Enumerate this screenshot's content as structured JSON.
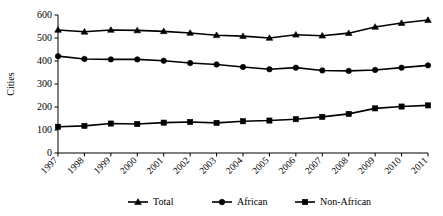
{
  "chart_data": {
    "type": "line",
    "title": "",
    "xlabel": "",
    "ylabel": "Cities",
    "ylim": [
      0,
      600
    ],
    "yticks": [
      0,
      100,
      200,
      300,
      400,
      500,
      600
    ],
    "grid": false,
    "legend_position": "bottom",
    "categories": [
      "1997",
      "1998",
      "1999",
      "2000",
      "2001",
      "2002",
      "2003",
      "2004",
      "2005",
      "2006",
      "2007",
      "2008",
      "2009",
      "2010",
      "2011"
    ],
    "series": [
      {
        "name": "Total",
        "marker": "triangle",
        "color": "#000000",
        "values": [
          535,
          527,
          535,
          533,
          529,
          522,
          512,
          508,
          500,
          514,
          510,
          521,
          548,
          565,
          578
        ]
      },
      {
        "name": "African",
        "marker": "circle",
        "color": "#000000",
        "values": [
          421,
          409,
          407,
          407,
          401,
          391,
          385,
          374,
          364,
          371,
          359,
          357,
          361,
          371,
          381
        ]
      },
      {
        "name": "Non-African",
        "marker": "square",
        "color": "#000000",
        "values": [
          114,
          118,
          128,
          126,
          132,
          135,
          131,
          138,
          141,
          147,
          157,
          170,
          194,
          202,
          207
        ]
      }
    ]
  },
  "legend": {
    "items": [
      {
        "label": "Total",
        "marker": "triangle"
      },
      {
        "label": "African",
        "marker": "circle"
      },
      {
        "label": "Non-African",
        "marker": "square"
      }
    ]
  }
}
